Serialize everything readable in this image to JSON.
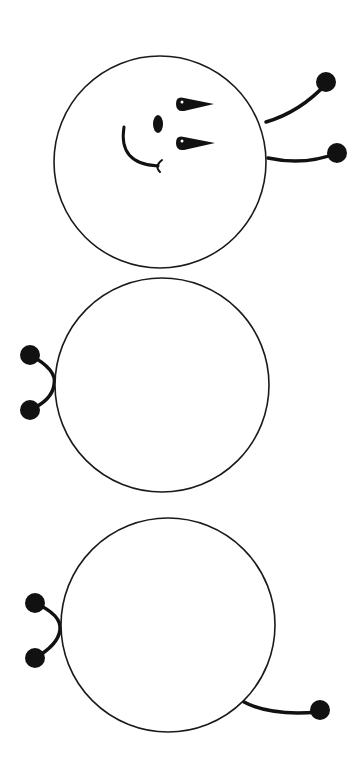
{
  "figure": {
    "colors": {
      "ink": "#111111",
      "background": "#ffffff"
    },
    "segments": [
      {
        "role": "head",
        "has_face": true,
        "appendages": [
          "antenna",
          "antenna"
        ]
      },
      {
        "role": "body",
        "has_face": false,
        "appendages": [
          "legs-pair"
        ]
      },
      {
        "role": "tail-end",
        "has_face": false,
        "appendages": [
          "legs-pair",
          "tail"
        ]
      }
    ]
  }
}
